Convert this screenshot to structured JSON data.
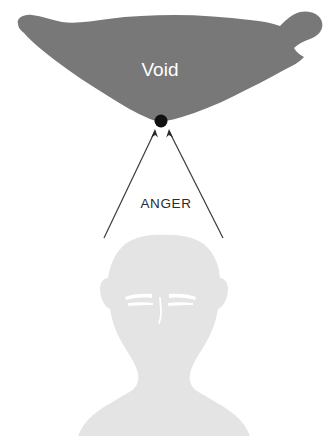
{
  "diagram": {
    "background_color": "#ffffff",
    "void": {
      "label": "Void",
      "fill_color": "#787878",
      "label_color": "#ffffff",
      "label_x": 160,
      "label_y": 76
    },
    "focal_point": {
      "name": "convergence-dot",
      "color": "#111111",
      "cx": 161,
      "cy": 121,
      "r": 6.5
    },
    "arrows": {
      "label": "ANGER",
      "label_color": "#2b2b2b",
      "label_x": 166,
      "label_y": 208,
      "stroke_color": "#3a3a3a",
      "stroke_width": 1.2,
      "left": {
        "x1": 104,
        "y1": 238,
        "x2": 155,
        "y2": 131
      },
      "right": {
        "x1": 223,
        "y1": 238,
        "x2": 169,
        "y2": 131
      }
    },
    "figure": {
      "name": "head-silhouette",
      "fill_color": "#e4e4e4",
      "feature_color": "#ffffff"
    }
  }
}
